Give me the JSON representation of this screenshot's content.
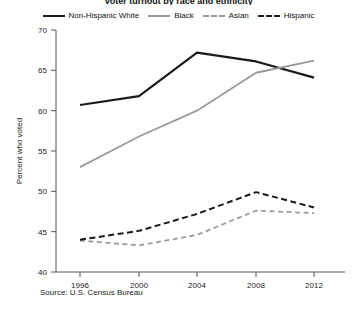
{
  "chart_data": {
    "type": "line",
    "title": "Voter turnout by race and ethnicity",
    "xlabel": "",
    "ylabel": "Percent who voted",
    "categories": [
      "1996",
      "2000",
      "2004",
      "2008",
      "2012"
    ],
    "x": [
      1996,
      2000,
      2004,
      2008,
      2012
    ],
    "xlim": [
      1994,
      2014
    ],
    "ylim": [
      40,
      70
    ],
    "yticks": [
      40,
      45,
      50,
      55,
      60,
      65,
      70
    ],
    "xticks": [
      "1996",
      "2000",
      "2004",
      "2008",
      "2012"
    ],
    "grid": false,
    "legend_position": "top-center",
    "series": [
      {
        "name": "Non-Hispanic White",
        "values": [
          60.7,
          61.8,
          67.2,
          66.1,
          64.1
        ],
        "color": "#1a1a1a",
        "style": "solid",
        "width": 2.2
      },
      {
        "name": "Black",
        "values": [
          53.0,
          56.8,
          60.0,
          64.7,
          66.2
        ],
        "color": "#9a9a9a",
        "style": "solid",
        "width": 1.8
      },
      {
        "name": "Asian",
        "values": [
          43.9,
          43.3,
          44.6,
          47.6,
          47.3
        ],
        "color": "#9a9a9a",
        "style": "dashed",
        "width": 1.8
      },
      {
        "name": "Hispanic",
        "values": [
          44.0,
          45.1,
          47.2,
          49.9,
          48.0
        ],
        "color": "#1a1a1a",
        "style": "dashed",
        "width": 2.0
      }
    ],
    "source_note": "Source: U.S. Census Bureau"
  },
  "legend": {
    "items": [
      {
        "label": "Non-Hispanic White"
      },
      {
        "label": "Black"
      },
      {
        "label": "Asian"
      },
      {
        "label": "Hispanic"
      }
    ]
  },
  "colors": {
    "dark": "#1a1a1a",
    "gray": "#9a9a9a",
    "axis": "#555555",
    "background": "#ffffff"
  }
}
